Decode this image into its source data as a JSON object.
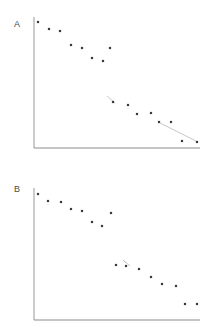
{
  "figure": {
    "width": 208,
    "height": 335,
    "background": "#ffffff",
    "axis_color": "#8c8c8c",
    "point_color": "#3a3a3a",
    "line_color": "#b9b9b9",
    "label_color": "#4a4a4a"
  },
  "panels": [
    {
      "id": "A",
      "label": "A",
      "label_x": 14,
      "label_y": 20,
      "axes": {
        "x_start": 34,
        "x_end": 200,
        "y_top": 17,
        "y_bottom": 148,
        "baseline_y": 148
      }
    },
    {
      "id": "B",
      "label": "B",
      "label_x": 14,
      "label_y": 185,
      "axes": {
        "x_start": 34,
        "x_end": 200,
        "y_top": 188,
        "y_bottom": 320,
        "baseline_y": 320
      }
    }
  ],
  "chart_data": [
    {
      "type": "scatter",
      "title": "A",
      "xlabel": "",
      "ylabel": "",
      "xlim": [
        34,
        200
      ],
      "ylim": [
        148,
        17
      ],
      "grid": false,
      "legend": null,
      "points": [
        {
          "x": 38,
          "y": 22
        },
        {
          "x": 49,
          "y": 29
        },
        {
          "x": 60,
          "y": 31
        },
        {
          "x": 71,
          "y": 45
        },
        {
          "x": 82,
          "y": 48
        },
        {
          "x": 92,
          "y": 58
        },
        {
          "x": 103,
          "y": 61
        },
        {
          "x": 110,
          "y": 48
        },
        {
          "x": 113,
          "y": 102
        },
        {
          "x": 128,
          "y": 105
        },
        {
          "x": 137,
          "y": 114
        },
        {
          "x": 151,
          "y": 113
        },
        {
          "x": 159,
          "y": 122
        },
        {
          "x": 171,
          "y": 122
        },
        {
          "x": 182,
          "y": 141
        },
        {
          "x": 197,
          "y": 142
        }
      ],
      "segments": [
        {
          "x1": 107,
          "y1": 96,
          "x2": 115,
          "y2": 103
        },
        {
          "x1": 160,
          "y1": 123,
          "x2": 198,
          "y2": 142
        }
      ]
    },
    {
      "type": "scatter",
      "title": "B",
      "xlabel": "",
      "ylabel": "",
      "xlim": [
        34,
        200
      ],
      "ylim": [
        320,
        188
      ],
      "grid": false,
      "legend": null,
      "points": [
        {
          "x": 38,
          "y": 194
        },
        {
          "x": 48,
          "y": 201
        },
        {
          "x": 61,
          "y": 202
        },
        {
          "x": 71,
          "y": 209
        },
        {
          "x": 82,
          "y": 211
        },
        {
          "x": 92,
          "y": 222
        },
        {
          "x": 102,
          "y": 226
        },
        {
          "x": 111,
          "y": 213
        },
        {
          "x": 116,
          "y": 265
        },
        {
          "x": 126,
          "y": 266
        },
        {
          "x": 139,
          "y": 269
        },
        {
          "x": 151,
          "y": 277
        },
        {
          "x": 162,
          "y": 284
        },
        {
          "x": 176,
          "y": 286
        },
        {
          "x": 185,
          "y": 304
        },
        {
          "x": 197,
          "y": 304
        }
      ],
      "segments": [
        {
          "x1": 123,
          "y1": 260,
          "x2": 130,
          "y2": 266
        },
        {
          "x1": 123,
          "y1": 260,
          "x2": 126,
          "y2": 263
        }
      ]
    }
  ]
}
